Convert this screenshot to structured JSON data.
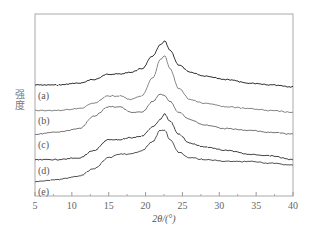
{
  "chart_data": {
    "type": "line",
    "title": "",
    "xlabel": "2θ/(°)",
    "ylabel": "强度",
    "xlim": [
      5,
      40
    ],
    "x_ticks": [
      5,
      10,
      15,
      20,
      25,
      30,
      35,
      40
    ],
    "y_ticks": [],
    "grid": false,
    "legend_position": "inline-left",
    "annotation": "Curves vertically offset (stacked XRD patterns); intensity in arbitrary units. Values below are approximate relative intensities read from pixel heights (0 = bottom of plot, 100 = top of plot).",
    "x": [
      5,
      8,
      11,
      13,
      15,
      16.5,
      18,
      19.5,
      21,
      22,
      22.6,
      23.3,
      24.5,
      26,
      28,
      31,
      34,
      37,
      40
    ],
    "series": [
      {
        "name": "(a)",
        "color": "#333333",
        "values": [
          61,
          61,
          62,
          64,
          67,
          67,
          68,
          70,
          77,
          83,
          85,
          80,
          72,
          68,
          66,
          64,
          62,
          61,
          60
        ]
      },
      {
        "name": "(b)",
        "color": "#888888",
        "values": [
          47,
          47,
          48,
          51,
          55,
          55,
          53,
          55,
          65,
          75,
          77,
          70,
          59,
          53,
          51,
          49,
          48,
          47,
          46
        ]
      },
      {
        "name": "(c)",
        "color": "#777777",
        "values": [
          34,
          35,
          37,
          44,
          49,
          49,
          46,
          46,
          52,
          56,
          55,
          52,
          46,
          42,
          39,
          37,
          36,
          35,
          34
        ]
      },
      {
        "name": "(d)",
        "color": "#444444",
        "values": [
          20,
          20,
          21,
          25,
          31,
          31,
          32,
          33,
          38,
          42,
          45,
          41,
          34,
          29,
          27,
          25,
          23,
          22,
          20
        ]
      },
      {
        "name": "(e)",
        "color": "#555555",
        "values": [
          8,
          9,
          11,
          15,
          21,
          23,
          23,
          25,
          30,
          36,
          36,
          31,
          24,
          21,
          20,
          19,
          19,
          18,
          17
        ]
      }
    ],
    "peaks": {
      "main_peak_2theta": 22.5,
      "secondary_hump_2theta": 16
    }
  },
  "labels": {
    "xaxis_title": "2θ/(°)",
    "yaxis_title": "强度",
    "ytitle_chars": [
      "强",
      "度"
    ],
    "x_tick_labels": [
      "5",
      "10",
      "15",
      "20",
      "25",
      "30",
      "35",
      "40"
    ],
    "curve_labels": [
      "(a)",
      "(b)",
      "(c)",
      "(d)",
      "(e)"
    ]
  }
}
